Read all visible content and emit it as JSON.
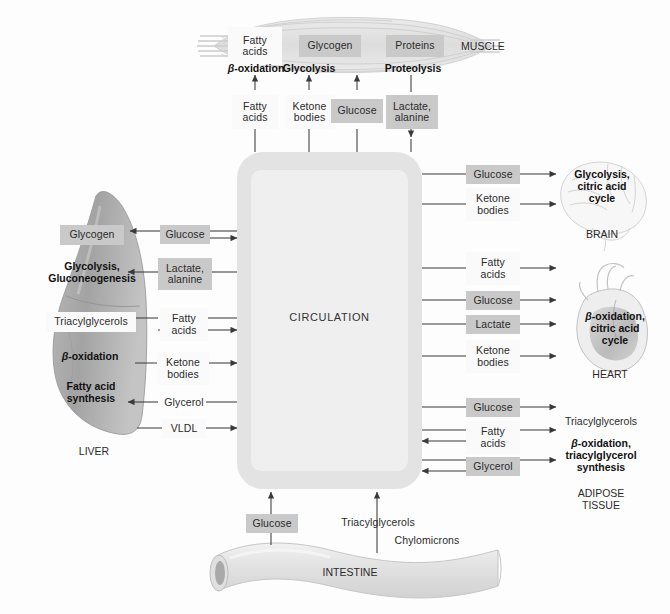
{
  "figure": {
    "central": {
      "label": "CIRCULATION"
    }
  },
  "organs": {
    "muscle": {
      "caption": "MUSCLE"
    },
    "liver": {
      "caption": "LIVER"
    },
    "brain": {
      "caption": "BRAIN"
    },
    "heart": {
      "caption": "HEART"
    },
    "adipose": {
      "caption": "ADIPOSE\nTISSUE"
    },
    "intestine": {
      "caption": "INTESTINE"
    }
  },
  "muscle_stores": [
    {
      "label": "Fatty\nacids",
      "style": "white"
    },
    {
      "label": "Glycogen",
      "style": "gray"
    },
    {
      "label": "Proteins",
      "style": "gray"
    }
  ],
  "muscle_processes": [
    {
      "label": "β-oxidation",
      "italic_prefix": true
    },
    {
      "label": "Glycolysis",
      "italic_prefix": false
    },
    {
      "label": "Proteolysis",
      "italic_prefix": false
    }
  ],
  "muscle_metabolites": [
    {
      "label": "Fatty\nacids",
      "style": "white",
      "direction": "up"
    },
    {
      "label": "Ketone\nbodies",
      "style": "white",
      "direction": "up"
    },
    {
      "label": "Glucose",
      "style": "gray",
      "direction": "up"
    },
    {
      "label": "Lactate,\nalanine",
      "style": "gray",
      "direction": "down"
    }
  ],
  "liver_contents": [
    {
      "label": "Glycogen",
      "kind": "chip",
      "style": "gray"
    },
    {
      "label": "Glycolysis,\nGluconeogenesis",
      "kind": "proc",
      "italic_prefix": false
    },
    {
      "label": "Triacylglycerols",
      "kind": "chip",
      "style": "white"
    },
    {
      "label": "β-oxidation",
      "kind": "proc",
      "italic_prefix": true
    },
    {
      "label": "Fatty acid\nsynthesis",
      "kind": "proc",
      "italic_prefix": false
    }
  ],
  "liver_metabolites": [
    {
      "label": "Glucose",
      "style": "gray",
      "to_organ": true,
      "to_circulation": true
    },
    {
      "label": "Lactate,\nalanine",
      "style": "gray",
      "to_organ": true,
      "to_circulation": false
    },
    {
      "label": "Fatty\nacids",
      "style": "white",
      "to_organ": true,
      "to_circulation": true
    },
    {
      "label": "Ketone\nbodies",
      "style": "white",
      "to_organ": false,
      "to_circulation": true
    },
    {
      "label": "Glycerol",
      "style": "none",
      "to_organ": true,
      "to_circulation": false
    },
    {
      "label": "VLDL",
      "style": "white",
      "to_organ": false,
      "to_circulation": true
    }
  ],
  "brain_metabolites": [
    {
      "label": "Glucose",
      "style": "gray"
    },
    {
      "label": "Ketone\nbodies",
      "style": "white"
    }
  ],
  "brain_processes": {
    "label": "Glycolysis,\ncitric acid\ncycle",
    "italic_prefix": false
  },
  "heart_metabolites": [
    {
      "label": "Fatty\nacids",
      "style": "white"
    },
    {
      "label": "Glucose",
      "style": "gray"
    },
    {
      "label": "Lactate",
      "style": "gray"
    },
    {
      "label": "Ketone\nbodies",
      "style": "white"
    }
  ],
  "heart_processes": {
    "label": "β-oxidation,\ncitric acid\ncycle",
    "italic_prefix": true
  },
  "adipose_metabolites": [
    {
      "label": "Glucose",
      "style": "gray",
      "direction": "to-organ"
    },
    {
      "label": "Fatty\nacids",
      "style": "white",
      "direction": "both"
    },
    {
      "label": "Glycerol",
      "style": "gray",
      "direction": "both"
    }
  ],
  "adipose_contents": [
    {
      "label": "Triacylglycerols",
      "kind": "cap",
      "italic_prefix": false
    },
    {
      "label": "β-oxidation,\ntriacylglycerol\nsynthesis",
      "kind": "proc",
      "italic_prefix": true
    }
  ],
  "intestine_metabolites": [
    {
      "label": "Glucose",
      "style": "gray"
    },
    {
      "label": "Triacylglycerols",
      "style": "none"
    },
    {
      "label": "Chylomicrons",
      "style": "none"
    }
  ],
  "colors": {
    "chip_gray": "#c9c9c9",
    "chip_white": "#fafafa",
    "circulation_outer": "#e3e3e3",
    "circulation_inner": "#efefef",
    "organ_gray": "#a8a8a8",
    "line": "#3a3a3a",
    "background": "#fdfdfd"
  }
}
